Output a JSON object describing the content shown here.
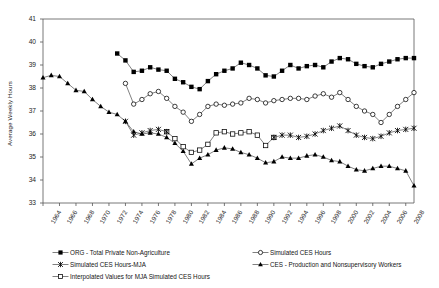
{
  "chart_data": {
    "type": "line",
    "title": "",
    "xlabel": "",
    "ylabel": "Average Weekly Hours",
    "ylim": [
      33,
      41
    ],
    "yticks": [
      33,
      34,
      35,
      36,
      37,
      38,
      39,
      40,
      41
    ],
    "xlim": [
      1964,
      2009
    ],
    "xticks": [
      1964,
      1966,
      1968,
      1970,
      1972,
      1974,
      1976,
      1978,
      1980,
      1982,
      1984,
      1986,
      1988,
      1990,
      1992,
      1994,
      1996,
      1998,
      2000,
      2002,
      2004,
      2006,
      2008
    ],
    "grid": false,
    "legend_position": "below",
    "series": [
      {
        "name": "ORG - Total Private Non-Agriculture",
        "marker": "filled-square",
        "color": "#000000",
        "x": [
          1973,
          1974,
          1975,
          1976,
          1977,
          1978,
          1979,
          1980,
          1981,
          1982,
          1983,
          1984,
          1985,
          1986,
          1987,
          1988,
          1989,
          1990,
          1991,
          1992,
          1993,
          1994,
          1995,
          1996,
          1997,
          1998,
          1999,
          2000,
          2001,
          2002,
          2003,
          2004,
          2005,
          2006,
          2007,
          2008,
          2009
        ],
        "values": [
          39.5,
          39.2,
          38.7,
          38.75,
          38.9,
          38.8,
          38.75,
          38.4,
          38.25,
          38.05,
          37.95,
          38.3,
          38.6,
          38.75,
          38.85,
          39.1,
          39.0,
          38.85,
          38.55,
          38.5,
          38.75,
          39.0,
          38.85,
          38.95,
          39.0,
          38.9,
          39.15,
          39.3,
          39.25,
          39.05,
          38.95,
          38.9,
          39.05,
          39.15,
          39.25,
          39.3,
          39.3
        ]
      },
      {
        "name": "Simulated CES Hours",
        "marker": "open-circle",
        "color": "#000000",
        "x": [
          1974,
          1975,
          1976,
          1977,
          1978,
          1979,
          1980,
          1981,
          1982,
          1983,
          1984,
          1985,
          1986,
          1987,
          1988,
          1989,
          1990,
          1991,
          1992,
          1993,
          1994,
          1995,
          1996,
          1997,
          1998,
          1999,
          2000,
          2001,
          2002,
          2003,
          2004,
          2005,
          2006,
          2007,
          2008,
          2009
        ],
        "values": [
          38.2,
          37.3,
          37.5,
          37.75,
          37.85,
          37.55,
          37.2,
          36.95,
          36.55,
          36.85,
          37.2,
          37.3,
          37.25,
          37.3,
          37.35,
          37.55,
          37.5,
          37.35,
          37.45,
          37.5,
          37.55,
          37.55,
          37.5,
          37.65,
          37.75,
          37.6,
          37.8,
          37.5,
          37.2,
          37.0,
          36.85,
          36.5,
          36.85,
          37.2,
          37.5,
          37.8
        ]
      },
      {
        "name": "Simulated CES Hours-MJA",
        "marker": "x-cross",
        "color": "#000000",
        "segments": [
          {
            "x": [
              1974,
              1975,
              1976,
              1977,
              1978,
              1979
            ],
            "values": [
              36.55,
              35.95,
              36.05,
              36.15,
              36.2,
              36.1
            ]
          },
          {
            "x": [
              1992,
              1993,
              1994,
              1995,
              1996,
              1997,
              1998,
              1999,
              2000,
              2001,
              2002,
              2003,
              2004,
              2005,
              2006,
              2007,
              2008,
              2009
            ],
            "values": [
              35.85,
              35.95,
              35.95,
              35.85,
              35.9,
              36.0,
              36.15,
              36.25,
              36.35,
              36.15,
              35.95,
              35.85,
              35.8,
              35.9,
              36.05,
              36.15,
              36.2,
              36.25
            ]
          }
        ]
      },
      {
        "name": "Interpolated Values for MJA Simulated CES Hours",
        "marker": "open-square",
        "color": "#000000",
        "x": [
          1979,
          1980,
          1981,
          1982,
          1983,
          1984,
          1985,
          1986,
          1987,
          1988,
          1989,
          1990,
          1991,
          1992
        ],
        "values": [
          36.1,
          35.8,
          35.45,
          35.2,
          35.3,
          35.55,
          36.05,
          36.1,
          36.0,
          36.05,
          36.1,
          35.95,
          35.5,
          35.85
        ]
      },
      {
        "name": "CES - Production and Nonsupervisory Workers",
        "marker": "filled-triangle",
        "color": "#000000",
        "x": [
          1964,
          1965,
          1966,
          1967,
          1968,
          1969,
          1970,
          1971,
          1972,
          1973,
          1974,
          1975,
          1976,
          1977,
          1978,
          1979,
          1980,
          1981,
          1982,
          1983,
          1984,
          1985,
          1986,
          1987,
          1988,
          1989,
          1990,
          1991,
          1992,
          1993,
          1994,
          1995,
          1996,
          1997,
          1998,
          1999,
          2000,
          2001,
          2002,
          2003,
          2004,
          2005,
          2006,
          2007,
          2008,
          2009
        ],
        "values": [
          38.45,
          38.55,
          38.5,
          38.2,
          37.9,
          37.85,
          37.5,
          37.2,
          36.95,
          36.85,
          36.55,
          36.1,
          36.0,
          36.05,
          36.0,
          35.85,
          35.6,
          35.25,
          34.7,
          34.95,
          35.1,
          35.3,
          35.4,
          35.35,
          35.2,
          35.1,
          34.95,
          34.75,
          34.8,
          35.0,
          34.95,
          34.95,
          35.05,
          35.1,
          35.0,
          34.85,
          34.8,
          34.6,
          34.45,
          34.4,
          34.5,
          34.6,
          34.6,
          34.5,
          34.4,
          33.75
        ]
      }
    ]
  },
  "axis": {
    "ylabel": "Average Weekly Hours",
    "ytick_labels": [
      "41",
      "40",
      "39",
      "38",
      "37",
      "36",
      "35",
      "34",
      "33"
    ],
    "xtick_labels": [
      "1964",
      "1966",
      "1968",
      "1970",
      "1972",
      "1974",
      "1976",
      "1978",
      "1980",
      "1982",
      "1984",
      "1986",
      "1988",
      "1990",
      "1992",
      "1994",
      "1996",
      "1998",
      "2000",
      "2002",
      "2004",
      "2006",
      "2008"
    ]
  },
  "legend": {
    "items": [
      {
        "label": "ORG - Total Private Non-Agriculture",
        "marker": "filled-square"
      },
      {
        "label": "Simulated CES Hours",
        "marker": "open-circle"
      },
      {
        "label": "Simulated CES Hours-MJA",
        "marker": "x-cross"
      },
      {
        "label": "CES - Production and Nonsupervisory Workers",
        "marker": "filled-triangle"
      },
      {
        "label": "Interpolated Values for MJA Simulated CES Hours",
        "marker": "open-square"
      }
    ]
  }
}
